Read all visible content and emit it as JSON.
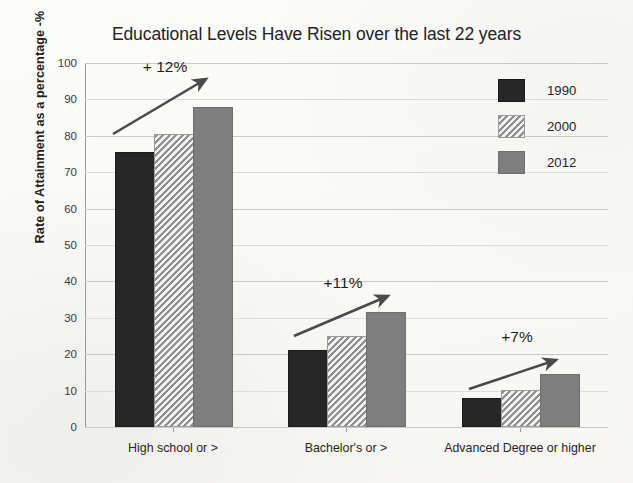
{
  "chart_data": {
    "type": "bar",
    "title": "Educational Levels Have Risen over the last 22 years",
    "xlabel": "",
    "ylabel": "Rate of Attainment as a percentage  -%",
    "ylim": [
      0,
      100
    ],
    "ytick_step": 10,
    "ytick_labels": [
      "0",
      "10",
      "20",
      "30",
      "40",
      "50",
      "60",
      "70",
      "80",
      "90",
      "100"
    ],
    "grid": true,
    "legend_position": "top-right",
    "categories": [
      "High school or >",
      "Bachelor's or >",
      "Advanced Degree or higher"
    ],
    "series": [
      {
        "name": "1990",
        "color": "#272727",
        "fill": "solid",
        "values": [
          75,
          20.5,
          7.3
        ]
      },
      {
        "name": "2000",
        "color": "#a8a8a8",
        "fill": "diagonal-hatch",
        "values": [
          80,
          24.5,
          9.5
        ]
      },
      {
        "name": "2012",
        "color": "#7e7e7e",
        "fill": "solid",
        "values": [
          87.5,
          31,
          14
        ]
      }
    ],
    "annotations": [
      {
        "label": "+ 12%",
        "group": "High school or >",
        "arrow": "up-right"
      },
      {
        "label": "+11%",
        "group": "Bachelor's or >",
        "arrow": "up-right"
      },
      {
        "label": "+7%",
        "group": "Advanced Degree or higher",
        "arrow": "up-right"
      }
    ]
  },
  "legend": {
    "items": [
      {
        "label": "1990"
      },
      {
        "label": "2000"
      },
      {
        "label": "2012"
      }
    ]
  }
}
